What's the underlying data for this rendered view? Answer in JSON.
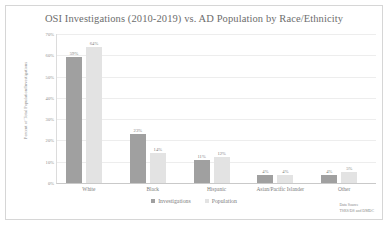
{
  "chart_data": {
    "type": "bar",
    "title": "OSI Investigations (2010-2019) vs. AD Population by Race/Ethnicity",
    "xlabel": "",
    "ylabel": "Percent of Total Population/Investigations",
    "ylim": [
      0,
      70
    ],
    "ytick_labels": [
      "0%",
      "10%",
      "20%",
      "30%",
      "40%",
      "50%",
      "60%",
      "70%"
    ],
    "ytick_values": [
      0,
      10,
      20,
      30,
      40,
      50,
      60,
      70
    ],
    "grid": true,
    "legend_position": "bottom",
    "categories": [
      "White",
      "Black",
      "Hispanic",
      "Asian/Pacific Islander",
      "Other"
    ],
    "series": [
      {
        "name": "Investigations",
        "color": "#a0a0a0",
        "values": [
          59,
          23,
          11,
          4,
          4
        ],
        "labels": [
          "59%",
          "23%",
          "11%",
          "4%",
          "4%"
        ]
      },
      {
        "name": "Population",
        "color": "#e3e3e3",
        "values": [
          64,
          14,
          12,
          4,
          5
        ],
        "labels": [
          "64%",
          "14%",
          "12%",
          "4%",
          "5%"
        ]
      }
    ],
    "annotations": {
      "source_line1": "Data Source",
      "source_line2": "TSRS/DS and DMDC"
    }
  }
}
